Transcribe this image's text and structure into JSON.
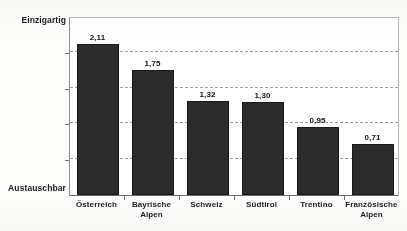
{
  "chart_data": {
    "type": "bar",
    "title": "",
    "xlabel": "",
    "ylabel": "",
    "categories": [
      "Österreich",
      "Bayrische Alpen",
      "Schweiz",
      "Südtirol",
      "Trentino",
      "Französische Alpen"
    ],
    "category_lines": [
      [
        "Österreich"
      ],
      [
        "Bayrische",
        "Alpen"
      ],
      [
        "Schweiz"
      ],
      [
        "Südtirol"
      ],
      [
        "Trentino"
      ],
      [
        "Französische",
        "Alpen"
      ]
    ],
    "values": [
      2.11,
      1.75,
      1.32,
      1.3,
      0.95,
      0.71
    ],
    "value_labels": [
      "2,11",
      "1,75",
      "1,32",
      "1,30",
      "0,95",
      "0,71"
    ],
    "ylim": [
      0,
      2.5
    ],
    "y_axis_top_label": "Einzigartig",
    "y_axis_bottom_label": "Austauschbar",
    "y_tick_values": [
      0.5,
      1.0,
      1.5,
      2.0
    ],
    "grid": true,
    "grid_style": "dashed",
    "legend": false,
    "bar_color": "#2b2b2b",
    "background_color": "#fdfdfc"
  },
  "axis": {
    "top_label": "Einzigartig",
    "bottom_label": "Austauschbar"
  },
  "title_remnant": "",
  "colors": {
    "bar": "#2b2b2b",
    "grid": "#9d9d9d",
    "axis": "#6d6d6d",
    "text": "#1b1b1b",
    "background": "#fdfdfc"
  }
}
